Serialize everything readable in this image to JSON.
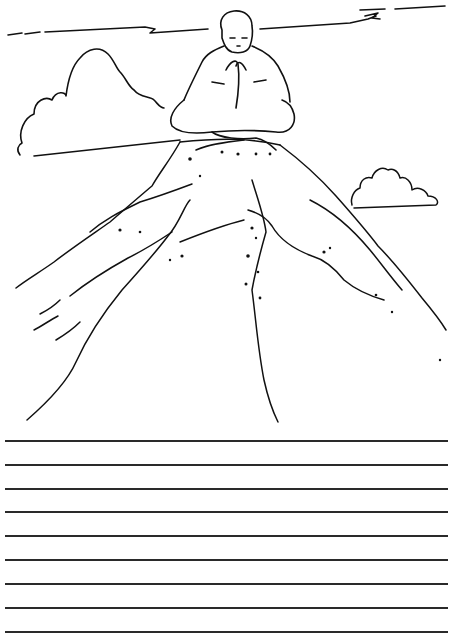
{
  "page": {
    "type": "coloring-and-writing-worksheet",
    "background": "#ffffff",
    "ink_color": "#111111"
  },
  "illustration": {
    "subject": "person meditating cross-legged on a mountain peak",
    "elements": [
      {
        "name": "meditating-person",
        "pose": "hands together in prayer, legs crossed"
      },
      {
        "name": "mountain",
        "detail": "rocky slopes with dots and ridges"
      },
      {
        "name": "left-cloud",
        "position": "upper-left"
      },
      {
        "name": "right-cloud",
        "position": "mid-right"
      },
      {
        "name": "sky-streaks",
        "position": "top horizontal cloud lines"
      }
    ]
  },
  "writing_lines": {
    "count": 9,
    "y_positions": [
      440,
      464,
      488,
      511,
      535,
      559,
      583,
      607,
      631
    ],
    "color": "#2a2a2a",
    "x_start": 5,
    "x_end": 448
  }
}
